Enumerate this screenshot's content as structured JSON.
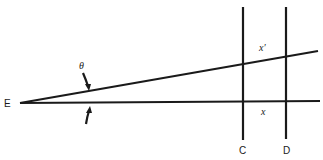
{
  "diagram": {
    "labels": {
      "vertex": "E",
      "angle": "θ",
      "upper_segment": "x′",
      "lower_segment": "x",
      "line_c": "C",
      "line_d": "D"
    },
    "colors": {
      "stroke": "#1a1a1a",
      "background": "#ffffff"
    }
  }
}
